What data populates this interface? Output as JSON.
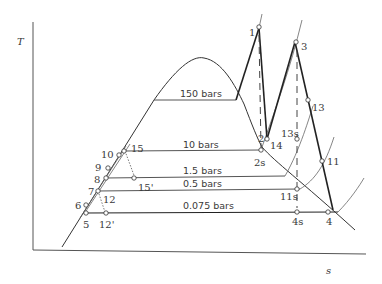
{
  "diagram": {
    "type": "T-s diagram (regenerative reheat Rankine cycle)",
    "axes": {
      "y_label": "T",
      "x_label": "s"
    },
    "isobars": [
      {
        "label": "150 bars"
      },
      {
        "label": "10 bars"
      },
      {
        "label": "1.5 bars"
      },
      {
        "label": "0.5 bars"
      },
      {
        "label": "0.075 bars"
      }
    ],
    "state_points": [
      {
        "id": "1",
        "label": "1"
      },
      {
        "id": "2",
        "label": "2"
      },
      {
        "id": "2s",
        "label": "2s"
      },
      {
        "id": "3",
        "label": "3"
      },
      {
        "id": "4",
        "label": "4"
      },
      {
        "id": "4s",
        "label": "4s"
      },
      {
        "id": "5",
        "label": "5"
      },
      {
        "id": "6",
        "label": "6"
      },
      {
        "id": "7",
        "label": "7"
      },
      {
        "id": "8",
        "label": "8"
      },
      {
        "id": "9",
        "label": "9"
      },
      {
        "id": "10",
        "label": "10"
      },
      {
        "id": "11",
        "label": "11"
      },
      {
        "id": "11s",
        "label": "11s"
      },
      {
        "id": "12",
        "label": "12"
      },
      {
        "id": "12p",
        "label": "12'"
      },
      {
        "id": "13",
        "label": "13"
      },
      {
        "id": "13s",
        "label": "13s"
      },
      {
        "id": "14",
        "label": "14"
      },
      {
        "id": "15",
        "label": "15"
      },
      {
        "id": "15p",
        "label": "15'"
      }
    ]
  }
}
